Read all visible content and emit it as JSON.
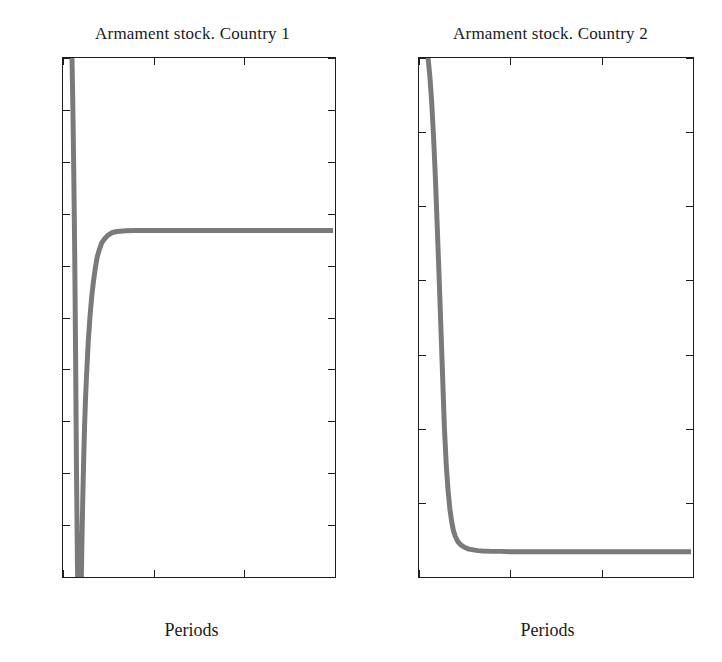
{
  "chart_data": [
    {
      "id": "country-1",
      "type": "line",
      "title": "Armament stock. Country 1",
      "xlabel": "Periods",
      "ylabel": "",
      "xlim": [
        0,
        30
      ],
      "ylim": [
        2,
        4
      ],
      "xticks": [
        0,
        10,
        20,
        30
      ],
      "xtick_labels": [
        "0",
        "10",
        "20",
        "30"
      ],
      "yticks": [
        2,
        2.2,
        2.4,
        2.6,
        2.8,
        3,
        3.2,
        3.4,
        3.6,
        3.8,
        4
      ],
      "ytick_labels": [
        "2",
        "2.2",
        "2.4",
        "2.6",
        "2.8",
        "3",
        "3.2",
        "3.4",
        "3.6",
        "3.8",
        "4"
      ],
      "grid": false,
      "legend": null,
      "line_color": "#7a7a7a",
      "line_width": 5,
      "series": [
        {
          "name": "Armament stock Country 1",
          "note": "Starts clipped at top (4) near period 1, plunges below the axis minimum, returns and converges to the steady state 3.33",
          "x": [
            1.0,
            1.1,
            1.2,
            1.3,
            1.4,
            1.5,
            1.6,
            1.7,
            1.8,
            1.9,
            2.0,
            2.1,
            2.2,
            2.3,
            2.4,
            2.5,
            2.6,
            2.8,
            3.0,
            3.2,
            3.4,
            3.6,
            3.8,
            4.0,
            4.3,
            4.6,
            5.0,
            5.5,
            6.0,
            7.0,
            8.0,
            10.0,
            14.0,
            20.0,
            25.0,
            30.0
          ],
          "y": [
            4.0,
            3.8,
            3.55,
            3.25,
            2.85,
            2.4,
            2.05,
            1.8,
            1.7,
            1.72,
            1.9,
            2.12,
            2.3,
            2.45,
            2.58,
            2.68,
            2.76,
            2.9,
            3.0,
            3.08,
            3.14,
            3.19,
            3.23,
            3.255,
            3.285,
            3.3,
            3.315,
            3.325,
            3.329,
            3.332,
            3.333,
            3.333,
            3.333,
            3.333,
            3.333,
            3.333
          ]
        }
      ],
      "steady_state": 3.333
    },
    {
      "id": "country-2",
      "type": "line",
      "title": "Armament stock. Country 2",
      "xlabel": "Periods",
      "ylabel": "",
      "xlim": [
        0,
        30
      ],
      "ylim": [
        2.6,
        4
      ],
      "xticks": [
        0,
        10,
        20,
        30
      ],
      "xtick_labels": [
        "0",
        "10",
        "20",
        "30"
      ],
      "yticks": [
        2.6,
        2.8,
        3,
        3.2,
        3.4,
        3.6,
        3.8,
        4
      ],
      "ytick_labels": [
        "2.6",
        "2.8",
        "3",
        "3.2",
        "3.4",
        "3.6",
        "3.8",
        "4"
      ],
      "grid": false,
      "legend": null,
      "line_color": "#7a7a7a",
      "line_width": 5,
      "series": [
        {
          "name": "Armament stock Country 2",
          "note": "Begins at 4 at period 1, decays monotonically and converges to the steady state 2.66",
          "x": [
            1.0,
            1.2,
            1.4,
            1.6,
            1.8,
            2.0,
            2.2,
            2.4,
            2.6,
            2.8,
            3.0,
            3.2,
            3.4,
            3.6,
            3.8,
            4.0,
            4.3,
            4.6,
            5.0,
            5.5,
            6.0,
            6.5,
            7.0,
            8.0,
            9.0,
            10.0,
            12.0,
            15.0,
            20.0,
            25.0,
            30.0
          ],
          "y": [
            4.0,
            3.95,
            3.88,
            3.79,
            3.68,
            3.55,
            3.42,
            3.28,
            3.14,
            3.0,
            2.9,
            2.83,
            2.78,
            2.745,
            2.72,
            2.705,
            2.69,
            2.682,
            2.675,
            2.67,
            2.668,
            2.666,
            2.665,
            2.664,
            2.664,
            2.663,
            2.663,
            2.663,
            2.663,
            2.663,
            2.663
          ]
        }
      ],
      "steady_state": 2.663
    }
  ],
  "figure": {
    "background_color": "#ffffff",
    "axis_color": "#1d1d1d",
    "text_color": "#1a1a1a",
    "top_cropped_caption": ""
  }
}
